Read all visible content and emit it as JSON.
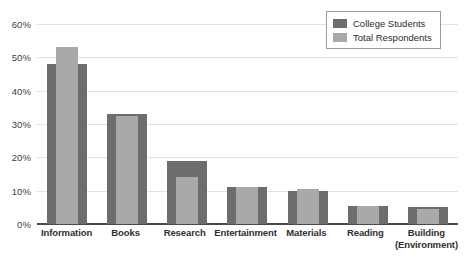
{
  "chart_data": {
    "type": "bar",
    "title": "",
    "xlabel": "",
    "ylabel": "",
    "ylim": [
      0,
      60
    ],
    "grid": true,
    "legend_position": "top-right",
    "categories": [
      "Information",
      "Books",
      "Research",
      "Entertainment",
      "Materials",
      "Reading",
      "Building (Environment)"
    ],
    "category_lines": [
      [
        "Information"
      ],
      [
        "Books"
      ],
      [
        "Research"
      ],
      [
        "Entertainment"
      ],
      [
        "Materials"
      ],
      [
        "Reading"
      ],
      [
        "Building",
        "(Environment)"
      ]
    ],
    "tick_labels": [
      "0%",
      "10%",
      "20%",
      "30%",
      "40%",
      "50%",
      "60%"
    ],
    "tick_values": [
      0,
      10,
      20,
      30,
      40,
      50,
      60
    ],
    "series": [
      {
        "name": "College Students",
        "color": "#6d6d6d",
        "values": [
          48,
          33,
          19,
          11,
          10,
          5.5,
          5
        ]
      },
      {
        "name": "Total Respondents",
        "color": "#a9a9a9",
        "values": [
          53,
          32.5,
          14,
          11,
          10.5,
          5.5,
          4.5
        ]
      }
    ]
  }
}
